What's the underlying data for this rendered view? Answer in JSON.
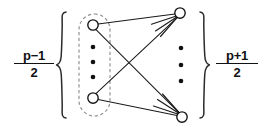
{
  "figure": {
    "type": "bipartite-graph-diagram",
    "width": 266,
    "height": 128,
    "background_color": "#ffffff",
    "ink_color": "#111111",
    "dashed_outline_color": "#8f8f8f"
  },
  "labels": {
    "left": {
      "numerator": "p−1",
      "denominator": "2",
      "full": "(p−1)/2",
      "meaning": "size of left vertex part"
    },
    "right": {
      "numerator": "p+1",
      "denominator": "2",
      "full": "(p+1)/2",
      "meaning": "size of right vertex part"
    }
  },
  "braces": {
    "left": {
      "glyph": "{",
      "x": 58,
      "top": 12,
      "bottom": 118
    },
    "right": {
      "glyph": "}",
      "x": 207,
      "top": 12,
      "bottom": 118
    }
  },
  "group_outline": {
    "shape": "dashed-stadium",
    "x": 79,
    "y": 14,
    "width": 31,
    "height": 102,
    "radius": 15.5
  },
  "nodes": {
    "left": [
      {
        "id": "L1",
        "cx": 93,
        "cy": 25,
        "r": 5.2,
        "shown": true
      },
      {
        "id": "L2",
        "cx": 93,
        "cy": 98,
        "r": 5.2,
        "shown": true
      }
    ],
    "right": [
      {
        "id": "R1",
        "cx": 180,
        "cy": 13,
        "r": 5.2,
        "shown": true
      },
      {
        "id": "R2",
        "cx": 182,
        "cy": 117,
        "r": 5.2,
        "shown": true
      }
    ]
  },
  "ellipses": {
    "left_column": {
      "cx": 93,
      "dots": [
        47,
        62,
        77
      ],
      "radius": 2.3
    },
    "right_column": {
      "cx": 181,
      "dots": [
        48,
        65,
        81
      ],
      "radius": 2.3
    }
  },
  "edges": [
    {
      "from": "L1",
      "to": "R1"
    },
    {
      "from": "L1",
      "to": "R2"
    },
    {
      "from": "L2",
      "to": "R1"
    },
    {
      "from": "L2",
      "to": "R2"
    }
  ],
  "stub_edges": {
    "from_R1": {
      "count": 3,
      "direction": "down-left",
      "meaning": "edges to omitted left vertices"
    },
    "from_R2": {
      "count": 3,
      "direction": "up-left",
      "meaning": "edges to omitted left vertices"
    }
  }
}
